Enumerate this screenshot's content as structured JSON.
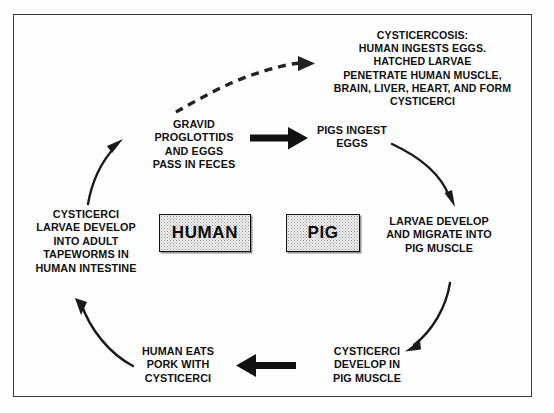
{
  "diagram": {
    "title_visible": false,
    "frame": {
      "stroke": "#3a3a3a"
    },
    "actors": [
      {
        "name": "human",
        "label": "HUMAN"
      },
      {
        "name": "pig",
        "label": "PIG"
      }
    ],
    "nodes": [
      {
        "id": "cysticercosis",
        "text": "CYSTICERCOSIS:\nHUMAN INGESTS EGGS.\nHATCHED LARVAE\nPENETRATE HUMAN MUSCLE,\nBRAIN, LIVER, HEART, AND FORM\nCYSTICERCI"
      },
      {
        "id": "gravid-proglottids",
        "text": "GRAVID\nPROGLOTTIDS\nAND EGGS\nPASS IN FECES"
      },
      {
        "id": "pigs-ingest-eggs",
        "text": "PIGS INGEST\nEGGS"
      },
      {
        "id": "larvae-develop",
        "text": "LARVAE DEVELOP\nAND MIGRATE INTO\nPIG MUSCLE"
      },
      {
        "id": "cysticerci-develop",
        "text": "CYSTICERCI\nDEVELOP IN\nPIG MUSCLE"
      },
      {
        "id": "human-eats-pork",
        "text": "HUMAN EATS\nPORK WITH\nCYSTICERCI"
      },
      {
        "id": "cysticerci-larvae-adult",
        "text": "CYSTICERCI\nLARVAE DEVELOP\nINTO ADULT\nTAPEWORMS IN\nHUMAN INTESTINE"
      }
    ],
    "arrows": [
      {
        "id": "dashed-to-cysticercosis",
        "style": "dashed",
        "from": "gravid-proglottids",
        "to": "cysticercosis"
      },
      {
        "id": "gravid-to-pigs",
        "style": "bold-straight",
        "from": "gravid-proglottids",
        "to": "pigs-ingest-eggs"
      },
      {
        "id": "pigs-to-larvae",
        "style": "curved",
        "from": "pigs-ingest-eggs",
        "to": "larvae-develop"
      },
      {
        "id": "larvae-to-cysticerci-pig",
        "style": "curved",
        "from": "larvae-develop",
        "to": "cysticerci-develop"
      },
      {
        "id": "cysticerci-pig-to-human-eats",
        "style": "bold-straight",
        "from": "cysticerci-develop",
        "to": "human-eats-pork"
      },
      {
        "id": "human-eats-to-intestine",
        "style": "curved",
        "from": "human-eats-pork",
        "to": "cysticerci-larvae-adult"
      },
      {
        "id": "intestine-to-gravid",
        "style": "curved",
        "from": "cysticerci-larvae-adult",
        "to": "gravid-proglottids"
      }
    ],
    "colors": {
      "ink": "#101010",
      "frame": "#3a3a3a",
      "box_fill": "#f2f2f2",
      "stipple": "#9a9a9a"
    }
  }
}
